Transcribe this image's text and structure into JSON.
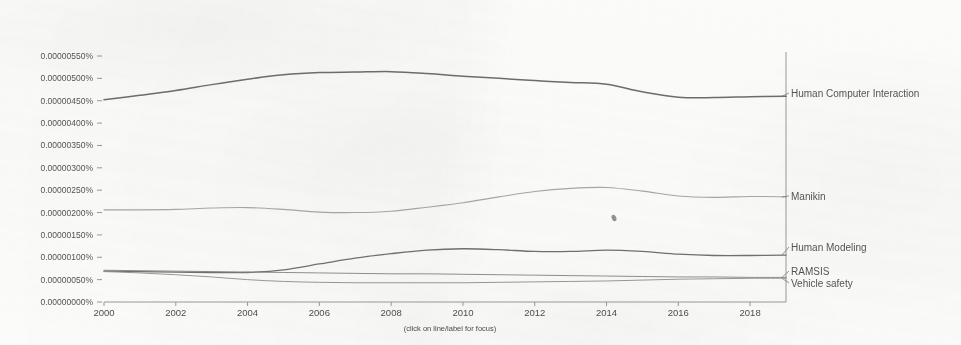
{
  "chart_data": {
    "type": "line",
    "title": "",
    "subtitle": "",
    "xlabel": "",
    "ylabel": "",
    "hint": "(click on line/label for focus)",
    "grid": false,
    "legend_position": "right-inline-labels",
    "xlim": [
      2000,
      2019
    ],
    "ylim": [
      0.0,
      5.5e-06
    ],
    "x_tick_labels": [
      "2000",
      "2002",
      "2004",
      "2006",
      "2008",
      "2010",
      "2012",
      "2014",
      "2016",
      "2018"
    ],
    "x_ticks": [
      2000,
      2002,
      2004,
      2006,
      2008,
      2010,
      2012,
      2014,
      2016,
      2018
    ],
    "y_tick_labels": [
      "0.00000550%",
      "0.00000500%",
      "0.00000450%",
      "0.00000400%",
      "0.00000350%",
      "0.00000300%",
      "0.00000250%",
      "0.00000200%",
      "0.00000150%",
      "0.00000100%",
      "0.00000050%",
      "0.00000000%"
    ],
    "y_ticks": [
      5.5e-06,
      5e-06,
      4.5e-06,
      4e-06,
      3.5e-06,
      3e-06,
      2.5e-06,
      2e-06,
      1.5e-06,
      1e-06,
      5e-07,
      0.0
    ],
    "x": [
      2000,
      2001,
      2002,
      2003,
      2004,
      2005,
      2006,
      2007,
      2008,
      2009,
      2010,
      2011,
      2012,
      2013,
      2014,
      2015,
      2016,
      2017,
      2018,
      2019
    ],
    "series": [
      {
        "name": "Human Computer Interaction",
        "color": "#5f5f5c",
        "width": 1.5,
        "label_color": "#55554f",
        "values": [
          4.52e-06,
          4.62e-06,
          4.73e-06,
          4.86e-06,
          4.98e-06,
          5.08e-06,
          5.13e-06,
          5.14e-06,
          5.15e-06,
          5.11e-06,
          5.05e-06,
          5e-06,
          4.95e-06,
          4.91e-06,
          4.87e-06,
          4.7e-06,
          4.58e-06,
          4.57e-06,
          4.59e-06,
          4.6e-06
        ]
      },
      {
        "name": "Manikin",
        "color": "#9d9d99",
        "width": 1.1,
        "label_color": "#9a9a95",
        "values": [
          2.06e-06,
          2.06e-06,
          2.07e-06,
          2.1e-06,
          2.11e-06,
          2.07e-06,
          2.01e-06,
          2e-06,
          2.03e-06,
          2.12e-06,
          2.22e-06,
          2.35e-06,
          2.47e-06,
          2.54e-06,
          2.56e-06,
          2.48e-06,
          2.37e-06,
          2.34e-06,
          2.36e-06,
          2.35e-06
        ]
      },
      {
        "name": "Human Modeling",
        "color": "#63635f",
        "width": 1.3,
        "label_color": "#55554f",
        "values": [
          6.9e-07,
          6.8e-07,
          6.7e-07,
          6.6e-07,
          6.6e-07,
          7.2e-07,
          8.5e-07,
          9.8e-07,
          1.08e-06,
          1.16e-06,
          1.19e-06,
          1.17e-06,
          1.13e-06,
          1.13e-06,
          1.16e-06,
          1.13e-06,
          1.07e-06,
          1.04e-06,
          1.04e-06,
          1.05e-06
        ]
      },
      {
        "name": "RAMSIS",
        "color": "#84847f",
        "width": 1.0,
        "label_color": "#55554f",
        "values": [
          7.1e-07,
          7e-07,
          6.9e-07,
          6.8e-07,
          6.7e-07,
          6.6e-07,
          6.5e-07,
          6.4e-07,
          6.3e-07,
          6.3e-07,
          6.2e-07,
          6.1e-07,
          6e-07,
          5.9e-07,
          5.8e-07,
          5.7e-07,
          5.6e-07,
          5.6e-07,
          5.5e-07,
          5.5e-07
        ]
      },
      {
        "name": "Vehicle safety",
        "color": "#8e8e89",
        "width": 1.0,
        "label_color": "#8c8c87",
        "values": [
          6.8e-07,
          6.5e-07,
          6.1e-07,
          5.6e-07,
          5e-07,
          4.6e-07,
          4.4e-07,
          4.3e-07,
          4.3e-07,
          4.3e-07,
          4.3e-07,
          4.4e-07,
          4.5e-07,
          4.6e-07,
          4.7e-07,
          4.9e-07,
          5.1e-07,
          5.2e-07,
          5.3e-07,
          5.3e-07
        ]
      }
    ],
    "series_label_positions": [
      {
        "name": "Human Computer Interaction",
        "y_px": 93
      },
      {
        "name": "Manikin",
        "y_px": 196
      },
      {
        "name": "Human Modeling",
        "y_px": 247
      },
      {
        "name": "RAMSIS",
        "y_px": 271
      },
      {
        "name": "Vehicle safety",
        "y_px": 283
      }
    ]
  }
}
